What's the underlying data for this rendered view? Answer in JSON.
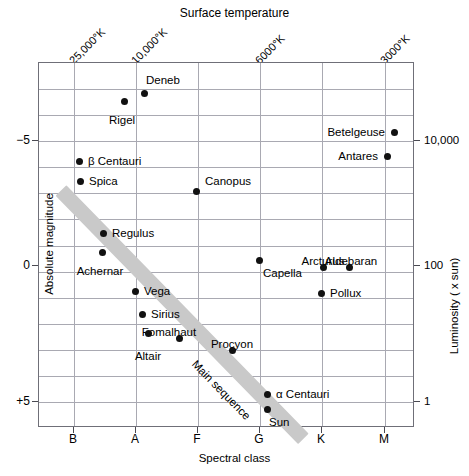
{
  "chart_data": {
    "type": "scatter",
    "top_axis_title": "Surface temperature",
    "xlabel": "Spectral class",
    "ylabel": "Absolute magnitude",
    "ylabel_right": "Luminosity ( x sun)",
    "grid": true,
    "legend": "none",
    "xlim": [
      "B",
      "M"
    ],
    "ylim": [
      -8,
      6
    ],
    "x_categories": [
      "B",
      "A",
      "F",
      "G",
      "K",
      "M"
    ],
    "x_tick_px": [
      73,
      135,
      197,
      259,
      321,
      384
    ],
    "temperature_ticks": [
      {
        "label": "25,000°K",
        "x_px": 73
      },
      {
        "label": "10,000°K",
        "x_px": 135
      },
      {
        "label": "6000°K",
        "x_px": 259
      },
      {
        "label": "3000°K",
        "x_px": 384
      }
    ],
    "y_ticks": [
      {
        "label": "−5",
        "y_px": 140,
        "value": -5
      },
      {
        "label": "0",
        "y_px": 265,
        "value": 0
      },
      {
        "label": "+5",
        "y_px": 401,
        "value": 5
      }
    ],
    "luminosity_ticks": [
      {
        "label": "10,000",
        "y_px": 140,
        "value": 10000
      },
      {
        "label": "100",
        "y_px": 265,
        "value": 100
      },
      {
        "label": "1",
        "y_px": 401,
        "value": 1
      }
    ],
    "main_sequence_label": "Main sequence",
    "points": [
      {
        "name": "Deneb",
        "x_px": 143,
        "y_px": 92,
        "label_dx": 2,
        "label_dy": -13,
        "anchor": "r"
      },
      {
        "name": "Rigel",
        "x_px": 123,
        "y_px": 100,
        "label_dx": -2,
        "label_dy": 13,
        "anchor": "c"
      },
      {
        "name": "Betelgeuse",
        "x_px": 393,
        "y_px": 131,
        "label_dx": -9,
        "label_dy": 0,
        "anchor": "l"
      },
      {
        "name": "Antares",
        "x_px": 386,
        "y_px": 155,
        "label_dx": -9,
        "label_dy": 0,
        "anchor": "l"
      },
      {
        "name": "β Centauri",
        "x_px": 78,
        "y_px": 160,
        "label_dx": 9,
        "label_dy": 0,
        "anchor": "r"
      },
      {
        "name": "Spica",
        "x_px": 79,
        "y_px": 180,
        "label_dx": 9,
        "label_dy": 0,
        "anchor": "r"
      },
      {
        "name": "Canopus",
        "x_px": 195,
        "y_px": 190,
        "label_dx": 9,
        "label_dy": -10,
        "anchor": "r"
      },
      {
        "name": "Regulus",
        "x_px": 102,
        "y_px": 232,
        "label_dx": 9,
        "label_dy": 0,
        "anchor": "r"
      },
      {
        "name": "Achernar",
        "x_px": 101,
        "y_px": 251,
        "label_dx": -2,
        "label_dy": 13,
        "anchor": "c"
      },
      {
        "name": "Capella",
        "x_px": 258,
        "y_px": 259,
        "label_dx": 4,
        "label_dy": 13,
        "anchor": "r"
      },
      {
        "name": "Arcturus",
        "x_px": 322,
        "y_px": 266,
        "label_dx": 0,
        "label_dy": -12,
        "anchor": "c"
      },
      {
        "name": "Aldebaran",
        "x_px": 348,
        "y_px": 266,
        "label_dx": 2,
        "label_dy": -12,
        "anchor": "c"
      },
      {
        "name": "Pollux",
        "x_px": 320,
        "y_px": 292,
        "label_dx": 9,
        "label_dy": 0,
        "anchor": "r"
      },
      {
        "name": "Vega",
        "x_px": 134,
        "y_px": 290,
        "label_dx": 9,
        "label_dy": 0,
        "anchor": "r"
      },
      {
        "name": "Sirius",
        "x_px": 141,
        "y_px": 313,
        "label_dx": 9,
        "label_dy": 0,
        "anchor": "r"
      },
      {
        "name": "Fomalhaut",
        "x_px": 178,
        "y_px": 337,
        "label_dx": -10,
        "label_dy": -12,
        "anchor": "c"
      },
      {
        "name": "Altair",
        "x_px": 147,
        "y_px": 332,
        "label_dx": 0,
        "label_dy": 17,
        "anchor": "c"
      },
      {
        "name": "Procyon",
        "x_px": 231,
        "y_px": 349,
        "label_dx": 0,
        "label_dy": -12,
        "anchor": "c"
      },
      {
        "name": "α Centauri",
        "x_px": 266,
        "y_px": 393,
        "label_dx": 9,
        "label_dy": 0,
        "anchor": "r"
      },
      {
        "name": "Sun",
        "x_px": 266,
        "y_px": 408,
        "label_dx": 2,
        "label_dy": 13,
        "anchor": "r"
      }
    ]
  },
  "colors": {
    "point": "#111111",
    "grid": "#a9a9b2",
    "axis": "#6f6f78",
    "main_sequence_band": "#c9c9c9",
    "background": "#ffffff"
  }
}
